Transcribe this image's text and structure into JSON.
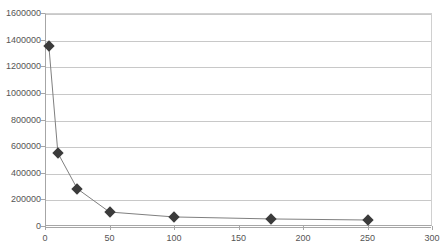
{
  "chart_data": {
    "type": "line",
    "title": "",
    "subtitle": "",
    "xlabel": "",
    "ylabel": "",
    "xlim": [
      0,
      300
    ],
    "ylim": [
      0,
      1600000
    ],
    "grid": true,
    "legend": false,
    "legend_position": "none",
    "marker": "diamond",
    "marker_color": "#3b3b3b",
    "line_color": "#808080",
    "gridline_color": "#c8c8c8",
    "axis_color": "#a6a6a6",
    "tick_label_color": "#555555",
    "background_color": "#ffffff",
    "x": [
      3,
      10,
      25,
      50,
      100,
      175,
      250
    ],
    "y": [
      1352000,
      548000,
      280000,
      105000,
      68000,
      53000,
      45000
    ],
    "series": [
      {
        "name": "",
        "points": [
          {
            "x": 3,
            "y": 1352000
          },
          {
            "x": 10,
            "y": 548000
          },
          {
            "x": 25,
            "y": 280000
          },
          {
            "x": 50,
            "y": 105000
          },
          {
            "x": 100,
            "y": 68000
          },
          {
            "x": 175,
            "y": 53000
          },
          {
            "x": 250,
            "y": 45000
          }
        ]
      }
    ],
    "xticks": [
      0,
      50,
      100,
      150,
      200,
      250,
      300
    ],
    "xtick_labels": [
      "0",
      "50",
      "100",
      "150",
      "200",
      "250",
      "300"
    ],
    "yticks": [
      0,
      200000,
      400000,
      600000,
      800000,
      1000000,
      1200000,
      1400000,
      1600000
    ],
    "ytick_labels": [
      "0",
      "200000",
      "400000",
      "600000",
      "800000",
      "1000000",
      "1200000",
      "1400000",
      "1600000"
    ]
  }
}
